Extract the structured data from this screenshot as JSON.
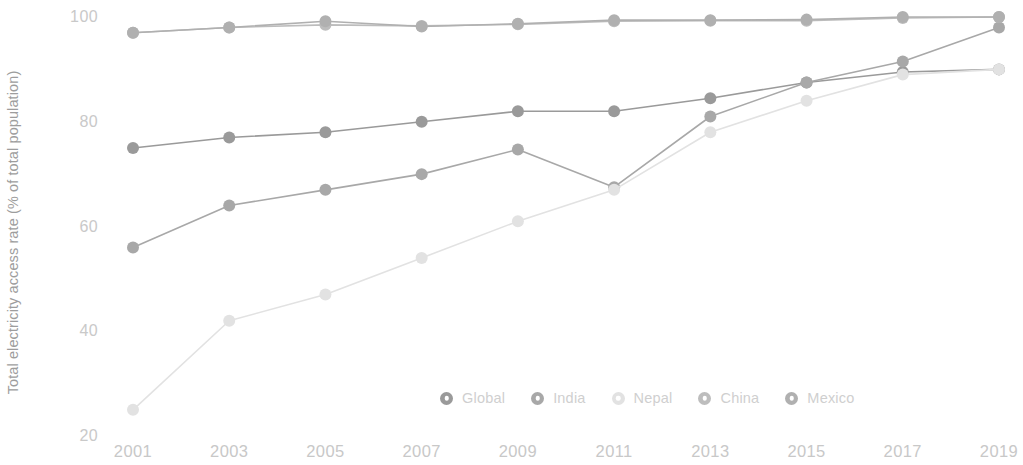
{
  "chart_data": {
    "type": "line",
    "title": "",
    "xlabel": "",
    "ylabel": "Total electricity access rate (% of total population)",
    "x": [
      2001,
      2003,
      2005,
      2007,
      2009,
      2011,
      2013,
      2015,
      2017,
      2019
    ],
    "xtick_labels": [
      "2001",
      "2003",
      "2005",
      "2007",
      "2009",
      "2011",
      "2013",
      "2015",
      "2017",
      "2019"
    ],
    "ytick_labels": [
      "100",
      "80",
      "60",
      "40",
      "20"
    ],
    "yticks": [
      100,
      80,
      60,
      40,
      20
    ],
    "ylim": [
      20,
      100
    ],
    "xlim": [
      2001,
      2019
    ],
    "grid": false,
    "legend_position": "bottom-center",
    "series": [
      {
        "name": "Global",
        "color": "#9a9a9a",
        "values": [
          75.0,
          77.0,
          78.0,
          80.0,
          82.0,
          82.0,
          84.5,
          87.5,
          89.5,
          90.0
        ]
      },
      {
        "name": "India",
        "color": "#a8a8a8",
        "values": [
          56.0,
          64.0,
          67.0,
          70.0,
          74.7,
          67.5,
          81.0,
          87.5,
          91.5,
          98.0
        ]
      },
      {
        "name": "Nepal",
        "color": "#e2e2e2",
        "values": [
          25.0,
          42.0,
          47.0,
          54.0,
          61.0,
          67.0,
          78.0,
          84.0,
          89.0,
          90.0
        ]
      },
      {
        "name": "China",
        "color": "#bdbdbd",
        "values": [
          97.0,
          98.0,
          98.5,
          98.3,
          98.6,
          99.2,
          99.3,
          99.3,
          99.8,
          100.0
        ]
      },
      {
        "name": "Mexico",
        "color": "#b0b0b0",
        "values": [
          97.0,
          98.0,
          99.2,
          98.2,
          98.7,
          99.4,
          99.4,
          99.5,
          100.0,
          100.0
        ]
      }
    ]
  },
  "legend": {
    "items": [
      {
        "label": "Global"
      },
      {
        "label": "India"
      },
      {
        "label": "Nepal"
      },
      {
        "label": "China"
      },
      {
        "label": "Mexico"
      }
    ]
  },
  "axes": {
    "y_title": "Total electricity access rate (% of total population)"
  }
}
